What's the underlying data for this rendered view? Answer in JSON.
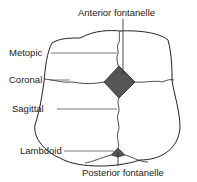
{
  "diagram": {
    "labels": {
      "anterior_fontanelle": "Anterior fontanelle",
      "metopic": "Metopic",
      "coronal": "Coronal",
      "sagittal": "Sagittal",
      "lambdoid": "Lambdoid",
      "posterior_fontanelle": "Posterior fontanelle"
    },
    "colors": {
      "fontanelle_fill": "#555555",
      "outline": "#222222"
    }
  }
}
